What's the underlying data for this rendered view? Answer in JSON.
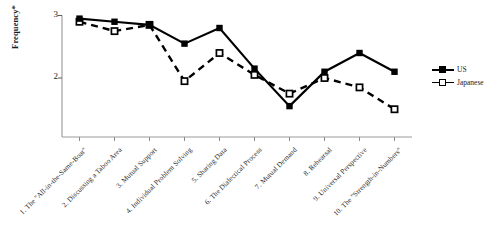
{
  "chart_data": {
    "type": "line",
    "title": "",
    "xlabel": "",
    "ylabel": "Frequency*",
    "ylim": [
      1,
      3
    ],
    "yticks": [
      2,
      3
    ],
    "ytick_labels": [
      "2",
      "3"
    ],
    "grid": false,
    "legend_position": "right",
    "categories": [
      "1. The \"All-in-the-Same-Boat\"",
      "2. Discussing a Taboo Area",
      "3. Mutual Support",
      "4. Individual Problem Solving",
      "5. Sharing Data",
      "6. The Dialectical Process",
      "7. Mutual Demand",
      "8. Rehearsal",
      "9. Universal Perspective",
      "10. The \"Strength-in-Numbers\""
    ],
    "series": [
      {
        "name": "US",
        "marker": "filled-square",
        "line": "solid",
        "color": "#000000",
        "values": [
          2.95,
          2.9,
          2.85,
          2.55,
          2.8,
          2.15,
          1.55,
          2.1,
          2.4,
          2.1
        ]
      },
      {
        "name": "Japanese",
        "marker": "open-square",
        "line": "dashed",
        "color": "#000000",
        "values": [
          2.9,
          2.75,
          2.85,
          1.95,
          2.4,
          2.05,
          1.75,
          2.0,
          1.85,
          1.5
        ]
      }
    ]
  },
  "legend": {
    "items": [
      {
        "label": "US"
      },
      {
        "label": "Japanese"
      }
    ]
  },
  "axis": {
    "y_label": "Frequency*",
    "y_tick_top": "3",
    "y_tick_bottom": "2"
  }
}
